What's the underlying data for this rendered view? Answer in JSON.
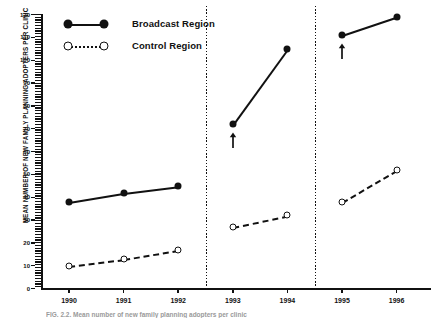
{
  "figure": {
    "caption": "FIG. 2.2.  Mean number of new family planning adopters per clinic"
  },
  "legend": {
    "position": "top-left",
    "items": [
      {
        "label": "Broadcast Region",
        "marker": "filled-circle",
        "line": "solid"
      },
      {
        "label": "Control Region",
        "marker": "open-circle",
        "line": "dotted"
      }
    ]
  },
  "chart_data": {
    "type": "line",
    "title": "",
    "xlabel": "",
    "ylabel": "MEAN NUMBER OF NEW FAMILY PLANNING ADOPTERS PER CLINIC",
    "x": [
      "1990",
      "1991",
      "1992",
      "1993",
      "1994",
      "1995",
      "1996"
    ],
    "xlim": [
      1989.55,
      1996.6
    ],
    "ylim": [
      0,
      120
    ],
    "ytick_labels": [
      "0",
      "10",
      "20",
      "30",
      "40",
      "50",
      "60",
      "70",
      "80",
      "90",
      "100",
      "110",
      "120"
    ],
    "ytick_values": [
      0,
      10,
      20,
      30,
      40,
      50,
      60,
      70,
      80,
      90,
      100,
      110,
      120
    ],
    "ytick_minor_step": 2,
    "grid": false,
    "series": [
      {
        "name": "Broadcast Region",
        "marker": "filled-circle",
        "line": "solid",
        "color": "#111111",
        "values": [
          38,
          42,
          45,
          72,
          105,
          111,
          119
        ]
      },
      {
        "name": "Control Region",
        "marker": "open-circle",
        "line": "dashed",
        "color": "#111111",
        "values": [
          10,
          13,
          17,
          27,
          32,
          38,
          52
        ]
      }
    ],
    "segments": [
      {
        "x_from": "1990",
        "x_to": "1992"
      },
      {
        "x_from": "1993",
        "x_to": "1994"
      },
      {
        "x_from": "1995",
        "x_to": "1996"
      }
    ],
    "dividers": [
      "1992.5",
      "1994.5"
    ],
    "annotations": [
      {
        "type": "arrow-up",
        "x": "1993",
        "series": "Broadcast Region",
        "label": ""
      },
      {
        "type": "arrow-up",
        "x": "1995",
        "series": "Broadcast Region",
        "label": ""
      }
    ]
  }
}
